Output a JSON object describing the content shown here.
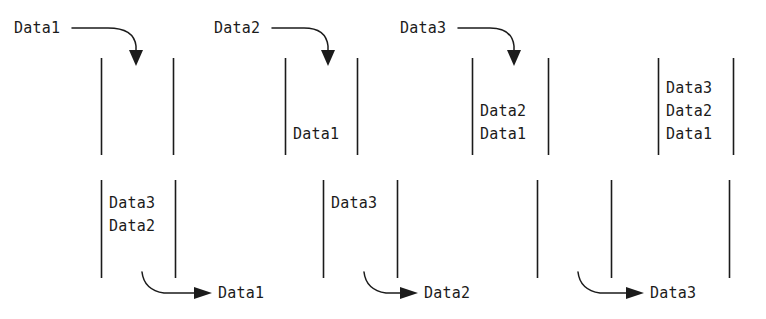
{
  "diagram": {
    "ink_color": "#1b1b1b",
    "background_color": "#ffffff",
    "push_row": {
      "operation": "push",
      "steps": [
        {
          "label": "Data1",
          "arrow": "push-arrow-curve-down",
          "contents": []
        },
        {
          "label": "Data2",
          "arrow": "push-arrow-curve-down",
          "contents": [
            "Data1"
          ]
        },
        {
          "label": "Data3",
          "arrow": "push-arrow-curve-down",
          "contents": [
            "Data2",
            "Data1"
          ]
        },
        {
          "label": "",
          "arrow": "",
          "contents": [
            "Data3",
            "Data2",
            "Data1"
          ]
        }
      ]
    },
    "pop_row": {
      "operation": "pop",
      "steps": [
        {
          "label": "Data1",
          "arrow": "pop-arrow-curve-right",
          "contents": [
            "Data3",
            "Data2"
          ]
        },
        {
          "label": "Data2",
          "arrow": "pop-arrow-curve-right",
          "contents": [
            "Data3"
          ]
        },
        {
          "label": "Data3",
          "arrow": "pop-arrow-curve-right",
          "contents": []
        },
        {
          "label": "",
          "arrow": "",
          "contents": []
        }
      ]
    }
  }
}
